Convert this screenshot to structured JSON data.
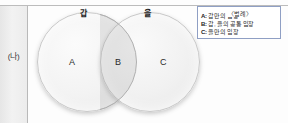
{
  "figure": {
    "label": "(나)",
    "top_rule": true
  },
  "venn": {
    "left_circle_title": "갑",
    "right_circle_title": "을",
    "regions": [
      {
        "letter": "A",
        "meaning": "갑만의 입장"
      },
      {
        "letter": "B",
        "meaning": "갑, 을의 공통 입장"
      },
      {
        "letter": "C",
        "meaning": "을만의 입장"
      }
    ]
  },
  "legend": {
    "caption": "〈범례〉",
    "entries": [
      {
        "key": "A:",
        "text": "갑만의 입장"
      },
      {
        "key": "B:",
        "text": "갑, 을의 공통 입장"
      },
      {
        "key": "C:",
        "text": "을만의 입장"
      }
    ]
  },
  "colors": {
    "circle_fill": "#f2f2f2",
    "circle_stroke": "#c9c9c9",
    "overlap_fill": "#d6d6d6",
    "legend_border": "#8f9fc4",
    "strip_fill": "#ececec",
    "rule": "#bcbcbc"
  }
}
